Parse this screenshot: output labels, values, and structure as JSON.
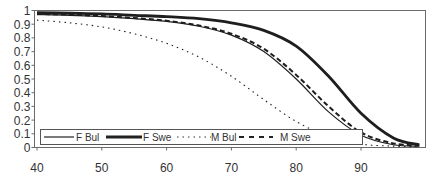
{
  "chart_data": {
    "type": "line",
    "title": "",
    "xlabel": "",
    "ylabel": "",
    "xlim": [
      40,
      100
    ],
    "ylim": [
      0,
      1
    ],
    "grid": false,
    "legend_position": "bottom-left inside plot",
    "x_ticks": [
      40,
      50,
      60,
      70,
      80,
      90
    ],
    "y_ticks": [
      0,
      0.1,
      0.2,
      0.3,
      0.4,
      0.5,
      0.6,
      0.7,
      0.8,
      0.9,
      1
    ],
    "y_tick_labels": [
      "0",
      "0.1",
      "0.2",
      "0.3",
      "0.4",
      "0.5",
      "0.6",
      "0.7",
      "0.8",
      "0.9",
      "1"
    ],
    "x": [
      40,
      45,
      50,
      55,
      60,
      65,
      70,
      75,
      80,
      85,
      90,
      95,
      99
    ],
    "series": [
      {
        "name": "F Bul",
        "style": "thin-solid",
        "values": [
          0.97,
          0.965,
          0.955,
          0.94,
          0.92,
          0.885,
          0.82,
          0.7,
          0.5,
          0.26,
          0.09,
          0.02,
          0.01
        ]
      },
      {
        "name": "F Swe",
        "style": "thick-solid",
        "values": [
          0.985,
          0.98,
          0.975,
          0.965,
          0.955,
          0.94,
          0.91,
          0.855,
          0.74,
          0.52,
          0.25,
          0.07,
          0.02
        ]
      },
      {
        "name": "M Bul",
        "style": "dotted",
        "values": [
          0.93,
          0.91,
          0.88,
          0.83,
          0.76,
          0.66,
          0.52,
          0.35,
          0.19,
          0.08,
          0.025,
          0.01,
          0.005
        ]
      },
      {
        "name": "M Swe",
        "style": "dashed",
        "values": [
          0.975,
          0.97,
          0.96,
          0.945,
          0.925,
          0.89,
          0.83,
          0.72,
          0.53,
          0.3,
          0.11,
          0.03,
          0.015
        ]
      }
    ]
  },
  "legend": {
    "items": [
      {
        "label": "F Bul"
      },
      {
        "label": "F Swe"
      },
      {
        "label": "M Bul"
      },
      {
        "label": "M Swe"
      }
    ]
  }
}
